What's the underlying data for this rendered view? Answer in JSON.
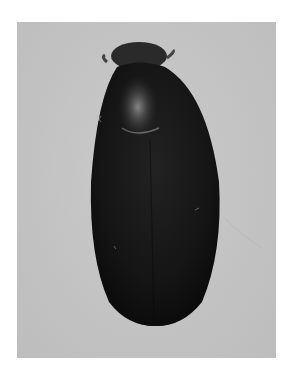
{
  "image": {
    "subject": "beetle specimen, dorsal view",
    "alt": "Dark glossy oval beetle photographed from above on a light grey background",
    "colors": {
      "background": "#c4c4c4",
      "body": "#161616",
      "pronotum_highlight": "#8a8a8a",
      "page": "#ffffff"
    }
  }
}
